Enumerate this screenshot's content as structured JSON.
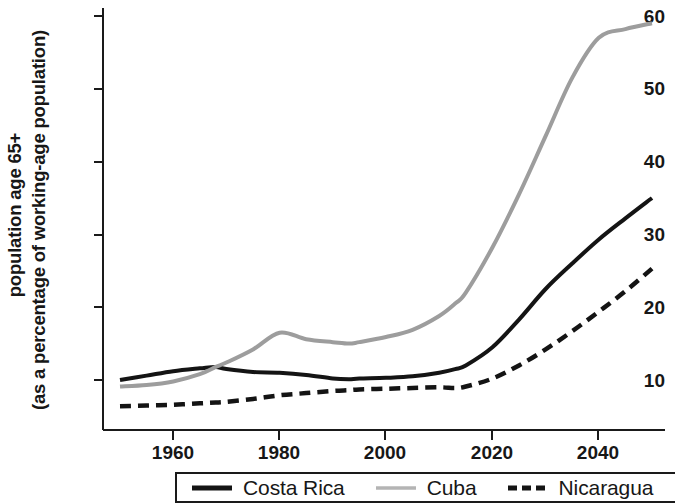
{
  "chart_data": {
    "type": "line",
    "title": "",
    "xlabel": "",
    "ylabel": "population age 65+ (as a percentage of working-age population)",
    "ylabel_line1": "population age 65+",
    "ylabel_line2": "(as a percentage of working-age population)",
    "xlim": [
      1950,
      2050
    ],
    "ylim": [
      3.1,
      60
    ],
    "grid": false,
    "legend_position": "bottom",
    "y_ticks": [
      10,
      20,
      30,
      40,
      50,
      60
    ],
    "y_tick_labels": [
      "10",
      "20",
      "30",
      "40",
      "50",
      "60"
    ],
    "x_ticks": [
      1960,
      1980,
      2000,
      2020,
      2040
    ],
    "x_tick_labels": [
      "1960",
      "1980",
      "2000",
      "2020",
      "2040"
    ],
    "x": [
      1950,
      1955,
      1960,
      1965,
      1968,
      1970,
      1975,
      1980,
      1985,
      1990,
      1993,
      1995,
      2000,
      2005,
      2010,
      2013,
      2015,
      2020,
      2025,
      2030,
      2035,
      2040,
      2045,
      2050
    ],
    "series": [
      {
        "name": "Costa Rica",
        "color": "#141414",
        "style": "solid",
        "width": 4,
        "values": [
          10.0,
          10.6,
          11.2,
          11.6,
          11.8,
          11.5,
          11.1,
          11.0,
          10.7,
          10.2,
          10.1,
          10.2,
          10.3,
          10.5,
          11.0,
          11.5,
          12.0,
          14.5,
          18.3,
          22.5,
          26.0,
          29.3,
          32.2,
          35.0
        ]
      },
      {
        "name": "Cuba",
        "color": "#9d9d9d",
        "style": "solid",
        "width": 4,
        "values": [
          9.1,
          9.3,
          9.8,
          10.8,
          11.8,
          12.4,
          14.2,
          16.5,
          15.6,
          15.2,
          15.0,
          15.2,
          15.9,
          16.9,
          18.8,
          20.5,
          22.0,
          28.2,
          35.5,
          43.5,
          51.5,
          57.0,
          58.2,
          59.0
        ]
      },
      {
        "name": "Nicaragua",
        "color": "#141414",
        "style": "dashed",
        "width": 4.5,
        "values": [
          6.4,
          6.5,
          6.6,
          6.8,
          6.9,
          7.0,
          7.4,
          7.9,
          8.2,
          8.5,
          8.6,
          8.7,
          8.8,
          8.9,
          9.0,
          8.9,
          9.1,
          10.2,
          12.0,
          14.2,
          16.7,
          19.4,
          22.2,
          25.3
        ]
      }
    ]
  },
  "legend": {
    "items": [
      {
        "label": "Costa Rica",
        "swatch": "solid-black-line",
        "color": "#141414"
      },
      {
        "label": "Cuba",
        "swatch": "solid-gray-line",
        "color": "#9d9d9d"
      },
      {
        "label": "Nicaragua",
        "swatch": "dashed-black-line",
        "color": "#141414"
      }
    ]
  },
  "axes": {
    "y_tick_labels": [
      "60",
      "50",
      "40",
      "30",
      "20",
      "10"
    ],
    "x_tick_labels": [
      "1960",
      "1980",
      "2000",
      "2020",
      "2040"
    ]
  }
}
